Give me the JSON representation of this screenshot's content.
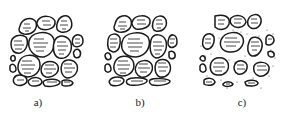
{
  "figure": {
    "panels": [
      {
        "id": "a",
        "label": "a)",
        "packing": "dense, particles in contact with fine particles filling gaps"
      },
      {
        "id": "b",
        "label": "b)",
        "packing": "skeleton of large particles in contact, few fines"
      },
      {
        "id": "c",
        "label": "c)",
        "packing": "particles floating in fine matrix (dotted fill)"
      }
    ]
  },
  "colors": {
    "stroke": "#1a1a1a",
    "background": "#ffffff",
    "fill_dots": "#555555"
  }
}
